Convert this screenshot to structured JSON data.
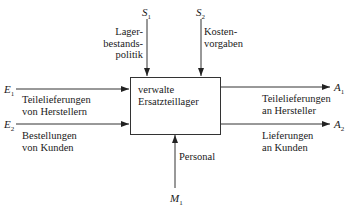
{
  "diagram": {
    "process_box": {
      "lines": [
        "verwalte",
        "Ersatzteillager"
      ]
    },
    "inputs": [
      {
        "symbol": "E",
        "index": "1",
        "label_lines": [
          "Teilelieferungen",
          "von Herstellern"
        ]
      },
      {
        "symbol": "E",
        "index": "2",
        "label_lines": [
          "Bestellungen",
          "von Kunden"
        ]
      }
    ],
    "controls": [
      {
        "symbol": "S",
        "index": "1",
        "label_lines": [
          "Lager-",
          "bestands-",
          "politik"
        ]
      },
      {
        "symbol": "S",
        "index": "2",
        "label_lines": [
          "Kosten-",
          "vorgaben"
        ]
      }
    ],
    "outputs": [
      {
        "symbol": "A",
        "index": "1",
        "label_lines": [
          "Teilelieferungen",
          "an Hersteller"
        ]
      },
      {
        "symbol": "A",
        "index": "2",
        "label_lines": [
          "Lieferungen",
          "an Kunden"
        ]
      }
    ],
    "mechanisms": [
      {
        "symbol": "M",
        "index": "1",
        "label_lines": [
          "Personal"
        ]
      }
    ]
  }
}
